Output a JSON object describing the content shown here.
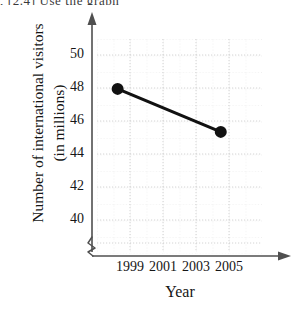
{
  "page": {
    "top_fragment": ", [2.4] Use the graph"
  },
  "chart_data": {
    "type": "line",
    "title": "",
    "xlabel": "Year",
    "ylabel": "Number of international visitors (in millions)",
    "ylabel_line1": "Number of international visitors",
    "ylabel_line2": "(in millions)",
    "x": [
      1999,
      2004
    ],
    "values": [
      48.6,
      46.1
    ],
    "series": [
      {
        "name": "International visitors",
        "x": [
          1999,
          2004
        ],
        "values": [
          48.6,
          46.1
        ]
      }
    ],
    "points": [
      {
        "x": 1999,
        "y": 48.6
      },
      {
        "x": 2004,
        "y": 46.1
      }
    ],
    "xticks": [
      "1999",
      "2001",
      "2003",
      "2005"
    ],
    "xtick_values": [
      1999,
      2001,
      2003,
      2005
    ],
    "yticks": [
      "40",
      "42",
      "44",
      "46",
      "48",
      "50"
    ],
    "ytick_values": [
      40,
      42,
      44,
      46,
      48,
      50
    ],
    "xlim": [
      1998,
      2006
    ],
    "ylim": [
      39,
      51.5
    ],
    "grid": true,
    "grid_style": "dotted",
    "legend": "none",
    "axis_break": true,
    "axis_arrows": true,
    "marker": "filled-circle",
    "line_color": "#111111",
    "marker_color": "#111111",
    "grid_color": "#cfcfcf",
    "axis_color": "#555555"
  }
}
